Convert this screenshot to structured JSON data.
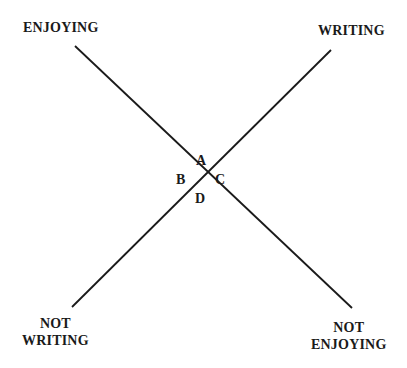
{
  "labels": {
    "top_left": "ENJOYING",
    "top_right": "WRITING",
    "bottom_left_1": "NOT",
    "bottom_left_2": "WRITING",
    "bottom_right_1": "NOT",
    "bottom_right_2": "ENJOYING"
  },
  "quadrants": {
    "top": "A",
    "left": "B",
    "right": "C",
    "bottom": "D"
  },
  "colors": {
    "line": "#1a1a1a",
    "background": "#ffffff"
  }
}
